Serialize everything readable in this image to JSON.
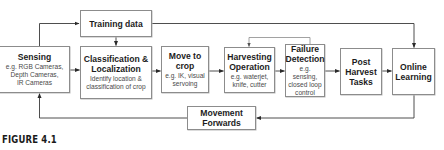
{
  "diagram": {
    "nodes": {
      "training_data": {
        "title": "Training data"
      },
      "sensing": {
        "title": "Sensing",
        "desc": "e.g. RGB Cameras,\nDepth Cameras,\nIR Cameras"
      },
      "classification": {
        "title": "Classification &\nLocalization",
        "desc": "Identify location &\nclassification of crop"
      },
      "move_to_crop": {
        "title": "Move to\ncrop",
        "desc": "e.g. IK, visual\nservoing"
      },
      "harvesting": {
        "title": "Harvesting\nOperation",
        "desc": "e.g. waterjet,\nknife, cutter"
      },
      "failure_detection": {
        "title": "Failure\nDetection",
        "desc": "e.g. sensing,\nclosed loop\ncontrol"
      },
      "post_harvest": {
        "title": "Post\nHarvest\nTasks"
      },
      "online_learning": {
        "title": "Online\nLearning"
      },
      "movement_forwards": {
        "title": "Movement\nForwards"
      }
    },
    "edges": [
      {
        "from": "sensing",
        "to": "training_data"
      },
      {
        "from": "training_data",
        "to": "classification"
      },
      {
        "from": "training_data",
        "to": "online_learning"
      },
      {
        "from": "sensing",
        "to": "classification"
      },
      {
        "from": "classification",
        "to": "move_to_crop"
      },
      {
        "from": "move_to_crop",
        "to": "harvesting"
      },
      {
        "from": "harvesting",
        "to": "failure_detection"
      },
      {
        "from": "failure_detection",
        "to": "harvesting"
      },
      {
        "from": "failure_detection",
        "to": "post_harvest"
      },
      {
        "from": "post_harvest",
        "to": "online_learning"
      },
      {
        "from": "online_learning",
        "to": "movement_forwards"
      },
      {
        "from": "movement_forwards",
        "to": "sensing"
      }
    ],
    "colors": {
      "line": "#3a3a3a",
      "feedback_line": "#8a8a8a",
      "border": "#8c8c8c"
    }
  },
  "caption": "FIGURE 4.1"
}
